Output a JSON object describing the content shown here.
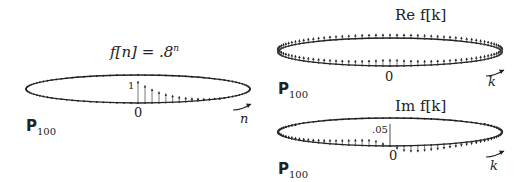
{
  "panels": [
    {
      "id": "time",
      "title_prefix": "f[n] = .8",
      "title_sup": "n",
      "axis_var": "n",
      "origin_label": "0",
      "tick_label": "1",
      "domain_label": "P",
      "domain_sub": "100"
    },
    {
      "id": "re",
      "title": "Re f[k]",
      "axis_var": "k",
      "origin_label": "0",
      "domain_label": "P",
      "domain_sub": "100"
    },
    {
      "id": "im",
      "title": "Im f[k]",
      "axis_var": "k",
      "origin_label": "0",
      "tick_label": ".05",
      "domain_label": "P",
      "domain_sub": "100"
    }
  ],
  "colors": {
    "ink": "#222222",
    "stem": "#555555",
    "background": "#ffffff"
  },
  "chart_data": [
    {
      "type": "stem",
      "title": "f[n] = .8^n",
      "domain": "P_100 (periodic, N=100)",
      "x": [
        0,
        1,
        2,
        3,
        4,
        5,
        6,
        7,
        8,
        9,
        10,
        11,
        12
      ],
      "values": [
        1,
        0.8,
        0.64,
        0.512,
        0.41,
        0.328,
        0.262,
        0.21,
        0.168,
        0.134,
        0.107,
        0.086,
        0.069
      ],
      "xlabel": "n",
      "tick_labels": [
        "0",
        "1"
      ]
    },
    {
      "type": "stem",
      "title": "Re f[k]",
      "domain": "P_100",
      "xlabel": "k",
      "shape": "peak at k=0, symmetric decay, small positive values around the ring"
    },
    {
      "type": "stem",
      "title": "Im f[k]",
      "domain": "P_100",
      "xlabel": "k",
      "tick_labels": [
        "0",
        ".05"
      ],
      "shape": "odd symmetry: positive for negative k, negative for positive k, zero at k=0"
    }
  ]
}
